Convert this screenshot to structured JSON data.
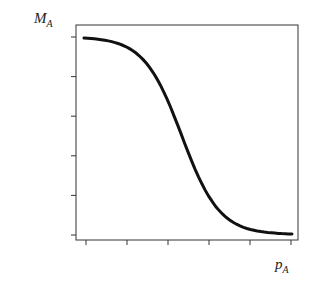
{
  "chart_data": {
    "type": "line",
    "title": "",
    "xlabel": "p_A",
    "ylabel": "M_A",
    "x_ticks": 6,
    "y_ticks": 6,
    "tick_labels_shown": false,
    "grid": false,
    "legend": null,
    "series": [
      {
        "name": "M_A vs p_A",
        "shape": "decreasing sigmoid",
        "x": [
          0.0,
          0.1,
          0.2,
          0.3,
          0.4,
          0.5,
          0.6,
          0.7,
          0.8,
          0.9,
          1.0
        ],
        "values": [
          1.0,
          0.99,
          0.96,
          0.86,
          0.66,
          0.42,
          0.2,
          0.08,
          0.03,
          0.01,
          0.0
        ]
      }
    ],
    "color": "#111111"
  },
  "labels": {
    "y_main": "M",
    "y_sub": "A",
    "x_main": "p",
    "x_sub": "A"
  }
}
